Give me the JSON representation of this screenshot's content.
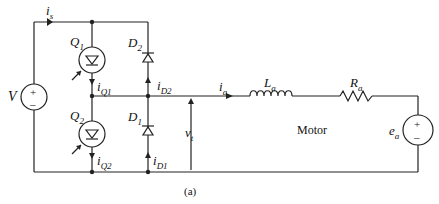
{
  "labels": {
    "source_v": "V",
    "i_s": "i",
    "i_s_sub": "s",
    "q1": "Q",
    "q1_sub": "1",
    "q2": "Q",
    "q2_sub": "2",
    "d1": "D",
    "d1_sub": "1",
    "d2": "D",
    "d2_sub": "2",
    "iq1": "i",
    "iq1_sub": "Q1",
    "iq2": "i",
    "iq2_sub": "Q2",
    "id1": "i",
    "id1_sub": "D1",
    "id2": "i",
    "id2_sub": "D2",
    "ia": "i",
    "ia_sub": "a",
    "vt": "v",
    "vt_sub": "t",
    "la": "L",
    "la_sub": "a",
    "ra": "R",
    "ra_sub": "a",
    "ea": "e",
    "ea_sub": "a",
    "motor": "Motor",
    "caption": "(a)",
    "plus": "+",
    "minus": "–"
  },
  "colors": {
    "line": "#222222",
    "background": "#ffffff"
  }
}
